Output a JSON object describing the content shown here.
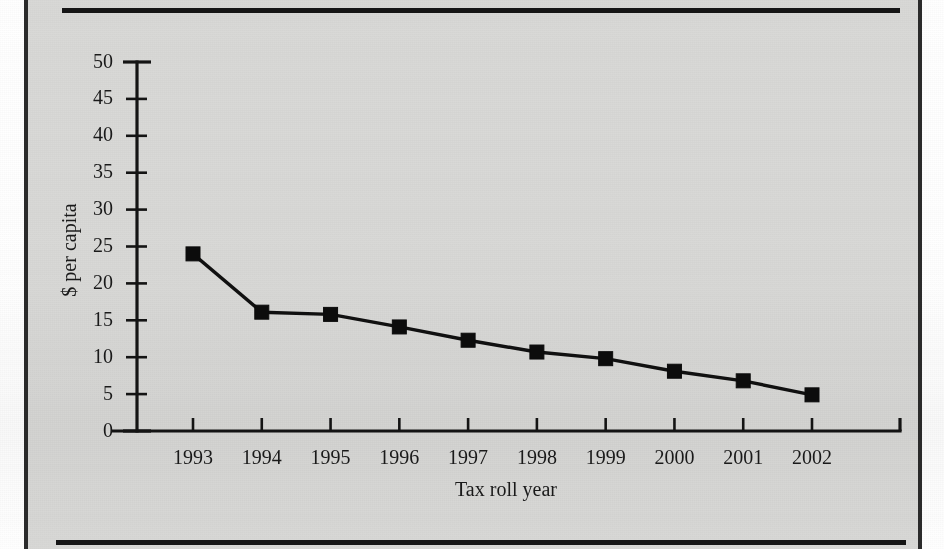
{
  "page": {
    "background_color": "#d9d9d7",
    "ink_color": "#141414",
    "frame": {
      "top_rule": "top-horizontal-rule",
      "bottom_rule": "bottom-horizontal-rule",
      "left_border": "left-vertical-border",
      "right_border": "right-vertical-border"
    }
  },
  "chart_data": {
    "type": "line",
    "title": "",
    "xlabel": "Tax roll year",
    "ylabel": "$ per capita",
    "categories": [
      "1993",
      "1994",
      "1995",
      "1996",
      "1997",
      "1998",
      "1999",
      "2000",
      "2001",
      "2002"
    ],
    "values": [
      24.0,
      16.1,
      15.8,
      14.1,
      12.3,
      10.7,
      9.8,
      8.1,
      6.8,
      4.9
    ],
    "series": [
      {
        "name": "$ per capita",
        "values": [
          24.0,
          16.1,
          15.8,
          14.1,
          12.3,
          10.7,
          9.8,
          8.1,
          6.8,
          4.9
        ]
      }
    ],
    "ylim": [
      0,
      50
    ],
    "ytick_step": 5,
    "yticks": [
      0,
      5,
      10,
      15,
      20,
      25,
      30,
      35,
      40,
      45,
      50
    ],
    "ytick_labels": [
      "0",
      "5",
      "10",
      "15",
      "20",
      "25",
      "30",
      "35",
      "40",
      "45",
      "50"
    ],
    "xtick_labels": [
      "1993",
      "1994",
      "1995",
      "1996",
      "1997",
      "1998",
      "1999",
      "2000",
      "2001",
      "2002"
    ],
    "grid": false,
    "legend": false,
    "legend_position": "none",
    "marker": "square",
    "line_color": "#101010",
    "marker_color": "#0c0c0c"
  }
}
